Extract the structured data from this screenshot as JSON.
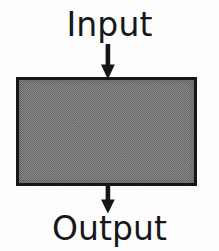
{
  "diagram": {
    "type": "block-flow",
    "background_color": "#fdfdfd",
    "nodes": [
      {
        "id": "input",
        "kind": "label",
        "text": "Input",
        "text_color": "#17171a",
        "font_size_px": 33
      },
      {
        "id": "process",
        "kind": "box",
        "text": "",
        "fill_color": "#8c8c8c",
        "border_color": "#16161a",
        "border_width_px": 3,
        "x": 16,
        "y": 77,
        "width": 181,
        "height": 109
      },
      {
        "id": "output",
        "kind": "label",
        "text": "Output",
        "text_color": "#17171a",
        "font_size_px": 33
      }
    ],
    "edges": [
      {
        "id": "input-arrow",
        "from": "input",
        "to": "process",
        "direction": "down",
        "color": "#16161a",
        "shaft_x": 108,
        "y_start": 46,
        "y_end": 78
      },
      {
        "id": "output-arrow",
        "from": "process",
        "to": "output",
        "direction": "down",
        "color": "#16161a",
        "shaft_x": 108,
        "y_start": 186,
        "y_end": 212
      }
    ]
  },
  "labels": {
    "input": "Input",
    "output": "Output"
  },
  "icons": {
    "input_arrow": "arrow-down-icon",
    "output_arrow": "arrow-down-icon"
  },
  "colors": {
    "ink": "#16161a",
    "text": "#17171a",
    "box_fill": "#8c8c8c",
    "background": "#fdfdfd"
  }
}
